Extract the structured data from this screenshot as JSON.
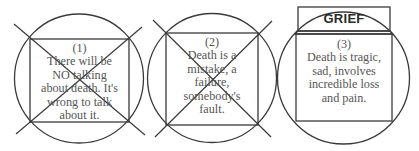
{
  "diagram": {
    "panels": [
      {
        "id": "panel-1",
        "number": "(1)",
        "lines": [
          "There will be",
          "NO talking",
          "about death. It's",
          "wrong to talk",
          "about it."
        ],
        "crossed_out": true,
        "label": null
      },
      {
        "id": "panel-2",
        "number": "(2)",
        "lines": [
          "Death is a",
          "mistake, a",
          "failure,",
          "somebody's",
          "fault."
        ],
        "crossed_out": true,
        "label": null
      },
      {
        "id": "panel-3",
        "number": "(3)",
        "lines": [
          "Death is tragic,",
          "sad, involves",
          "incredible loss",
          "and pain."
        ],
        "crossed_out": false,
        "label": "GRIEF"
      }
    ],
    "colors": {
      "line": "#3a3a3a",
      "text": "#555555",
      "label": "#2a2a2a"
    }
  }
}
